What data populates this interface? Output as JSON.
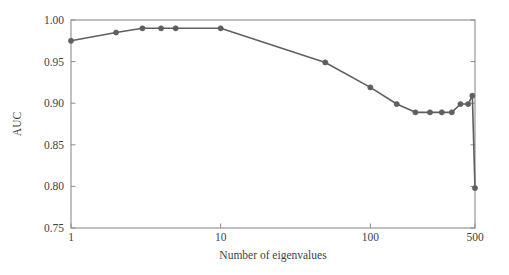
{
  "chart_data": {
    "type": "line",
    "title": "",
    "subtitle": "",
    "xlabel": "Number of eigenvalues",
    "ylabel": "AUC",
    "xscale": "log",
    "yscale": "linear",
    "xlim": [
      1,
      500
    ],
    "ylim": [
      0.75,
      1.0
    ],
    "grid": false,
    "legend": null,
    "legend_position": "none",
    "xticks": [
      1,
      10,
      100,
      500
    ],
    "xtick_labels": [
      "1",
      "10",
      "100",
      "500"
    ],
    "yticks": [
      0.75,
      0.8,
      0.85,
      0.9,
      0.95,
      1.0
    ],
    "ytick_labels": [
      "0.75",
      "0.80",
      "0.85",
      "0.90",
      "0.95",
      "1.00"
    ],
    "series": [
      {
        "name": "AUC",
        "color": "#5f5f5f",
        "marker": "circle",
        "x": [
          1,
          2,
          3,
          4,
          5,
          10,
          50,
          100,
          150,
          200,
          250,
          300,
          350,
          400,
          450,
          480,
          500
        ],
        "values": [
          0.975,
          0.985,
          0.99,
          0.99,
          0.99,
          0.99,
          0.949,
          0.919,
          0.899,
          0.889,
          0.889,
          0.889,
          0.889,
          0.899,
          0.899,
          0.909,
          0.798
        ]
      }
    ],
    "annotations": []
  },
  "style": {
    "line_color": "#5f5f5f",
    "marker_color": "#5f5f5f",
    "axis_color": "#8c8c8c",
    "text_color": "#3f3f3f",
    "background": "#ffffff"
  }
}
